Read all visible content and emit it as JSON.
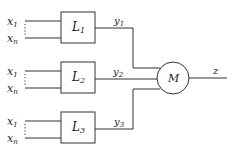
{
  "diagram": {
    "type": "block-diagram",
    "colors": {
      "stroke": "#333333",
      "text": "#222222",
      "background": "#ffffff"
    },
    "blocks": [
      {
        "id": "L1",
        "label": "L",
        "subscript": "1",
        "inputs": [
          "x",
          "x"
        ],
        "input_subscripts": [
          "1",
          "n"
        ],
        "output": "y",
        "output_subscript": "1"
      },
      {
        "id": "L2",
        "label": "L",
        "subscript": "2",
        "inputs": [
          "x",
          "x"
        ],
        "input_subscripts": [
          "1",
          "n"
        ],
        "output": "y",
        "output_subscript": "2"
      },
      {
        "id": "L3",
        "label": "L",
        "subscript": "3",
        "inputs": [
          "x",
          "x"
        ],
        "input_subscripts": [
          "1",
          "n"
        ],
        "output": "y",
        "output_subscript": "3"
      }
    ],
    "combiner": {
      "id": "M",
      "label": "M",
      "shape": "circle"
    },
    "final_output": {
      "label": "z"
    }
  }
}
